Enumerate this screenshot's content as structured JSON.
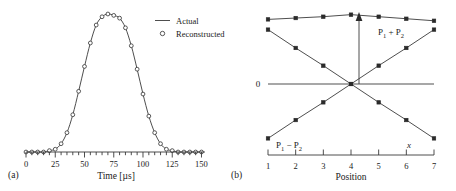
{
  "figure": {
    "panel_a_label": "(a)",
    "panel_b_label": "(b)"
  },
  "panel_a": {
    "xlabel": "Time [µs]",
    "xticks": [
      "0",
      "25",
      "50",
      "75",
      "100",
      "125",
      "150"
    ],
    "legend": {
      "actual": "Actual",
      "reconstructed": "Reconstructed"
    }
  },
  "panel_b": {
    "xlabel": "Position",
    "xticks": [
      "1",
      "2",
      "3",
      "4",
      "5",
      "6",
      "7"
    ],
    "zero_label": "0",
    "x_axis_symbol": "x",
    "sum_label_p": "P",
    "sum_label_sub1": "1",
    "sum_label_op": "+",
    "sum_label_p2": "P",
    "sum_label_sub2": "2",
    "diff_label_p": "P",
    "diff_label_sub1": "1",
    "diff_label_op": "−",
    "diff_label_p2": "P",
    "diff_label_sub2": "2"
  },
  "chart_data": [
    {
      "type": "line",
      "panel": "(a)",
      "title": "",
      "xlabel": "Time [µs]",
      "ylabel": "",
      "xlim": [
        0,
        153
      ],
      "ylim": [
        0,
        1.0
      ],
      "grid": false,
      "legend_position": "upper-right",
      "xticks_major": [
        0,
        25,
        50,
        75,
        100,
        125,
        150
      ],
      "xtick_minor_step": 5,
      "series": [
        {
          "name": "Actual",
          "style": "solid-line",
          "x": [
            0,
            5,
            10,
            15,
            20,
            25,
            30,
            35,
            40,
            45,
            50,
            55,
            60,
            65,
            70,
            75,
            80,
            85,
            90,
            95,
            100,
            105,
            110,
            115,
            120,
            125,
            130,
            135,
            140,
            145,
            150
          ],
          "values": [
            0.0,
            0.0,
            0.0,
            0.0,
            0.01,
            0.02,
            0.06,
            0.14,
            0.27,
            0.44,
            0.62,
            0.79,
            0.92,
            0.98,
            1.0,
            0.99,
            0.97,
            0.9,
            0.77,
            0.6,
            0.42,
            0.26,
            0.14,
            0.06,
            0.02,
            0.01,
            0.0,
            0.0,
            0.0,
            0.0,
            0.0
          ]
        },
        {
          "name": "Reconstructed",
          "style": "open-circle-markers",
          "x": [
            0,
            5,
            10,
            15,
            20,
            25,
            30,
            35,
            40,
            45,
            50,
            55,
            60,
            65,
            70,
            75,
            80,
            85,
            90,
            95,
            100,
            105,
            110,
            115,
            120,
            125,
            130,
            135,
            140,
            145,
            150
          ],
          "values": [
            0.0,
            0.0,
            0.0,
            0.0,
            0.01,
            0.02,
            0.06,
            0.14,
            0.27,
            0.44,
            0.62,
            0.79,
            0.92,
            0.98,
            1.0,
            0.99,
            0.97,
            0.9,
            0.77,
            0.6,
            0.42,
            0.26,
            0.14,
            0.06,
            0.02,
            0.01,
            0.0,
            0.0,
            0.0,
            0.0,
            0.0
          ]
        }
      ]
    },
    {
      "type": "line",
      "panel": "(b)",
      "title": "",
      "xlabel": "Position",
      "ylabel": "",
      "xlim": [
        1,
        7
      ],
      "ylim": [
        -1.05,
        1.12
      ],
      "grid": false,
      "annotations": [
        "P1 + P2",
        "P1 − P2",
        "x",
        "0"
      ],
      "xticks_major": [
        1,
        2,
        3,
        4,
        5,
        6,
        7
      ],
      "series": [
        {
          "name": "P1 + P2",
          "style": "line-with-square-markers",
          "x": [
            1,
            2,
            3,
            4,
            5,
            6,
            7
          ],
          "values": [
            0.95,
            0.97,
            0.99,
            1.02,
            0.99,
            0.96,
            0.93
          ]
        },
        {
          "name": "descending",
          "style": "line-with-square-markers",
          "x": [
            1,
            2,
            3,
            4,
            5,
            6,
            7
          ],
          "values": [
            0.8,
            0.53,
            0.27,
            0.0,
            -0.27,
            -0.53,
            -0.8
          ]
        },
        {
          "name": "P1 − P2",
          "style": "line-with-square-markers",
          "x": [
            1,
            2,
            3,
            4,
            5,
            6,
            7
          ],
          "values": [
            -0.8,
            -0.53,
            -0.27,
            0.0,
            0.27,
            0.53,
            0.8
          ]
        },
        {
          "name": "zero baseline",
          "style": "horizontal-rule",
          "x": [
            1,
            7
          ],
          "values": [
            0.0,
            0.0
          ]
        }
      ]
    }
  ]
}
